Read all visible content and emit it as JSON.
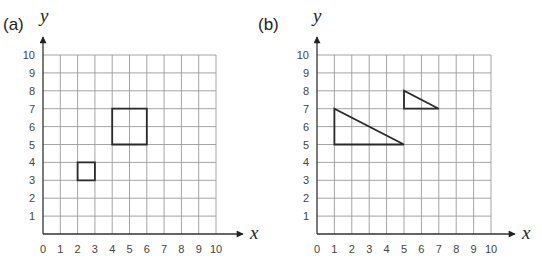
{
  "chart_data": [
    {
      "type": "diagram",
      "panel_label": "(a)",
      "xlabel": "x",
      "ylabel": "y",
      "xlim": [
        0,
        10
      ],
      "ylim": [
        0,
        10
      ],
      "grid": true,
      "x_ticks": [
        "0",
        "1",
        "2",
        "3",
        "4",
        "5",
        "6",
        "7",
        "8",
        "9",
        "10"
      ],
      "y_ticks": [
        "1",
        "2",
        "3",
        "4",
        "5",
        "6",
        "7",
        "8",
        "9",
        "10"
      ],
      "shapes": [
        {
          "name": "large-square",
          "kind": "rectangle",
          "points": [
            [
              4,
              5
            ],
            [
              6,
              5
            ],
            [
              6,
              7
            ],
            [
              4,
              7
            ]
          ]
        },
        {
          "name": "small-square",
          "kind": "rectangle",
          "points": [
            [
              2,
              3
            ],
            [
              3,
              3
            ],
            [
              3,
              4
            ],
            [
              2,
              4
            ]
          ]
        }
      ]
    },
    {
      "type": "diagram",
      "panel_label": "(b)",
      "xlabel": "x",
      "ylabel": "y",
      "xlim": [
        0,
        10
      ],
      "ylim": [
        0,
        10
      ],
      "grid": true,
      "x_ticks": [
        "0",
        "1",
        "2",
        "3",
        "4",
        "5",
        "6",
        "7",
        "8",
        "9",
        "10"
      ],
      "y_ticks": [
        "1",
        "2",
        "3",
        "4",
        "5",
        "6",
        "7",
        "8",
        "9",
        "10"
      ],
      "shapes": [
        {
          "name": "large-triangle",
          "kind": "triangle",
          "points": [
            [
              1,
              5
            ],
            [
              1,
              7
            ],
            [
              5,
              5
            ]
          ]
        },
        {
          "name": "small-triangle",
          "kind": "triangle",
          "points": [
            [
              5,
              7
            ],
            [
              5,
              8
            ],
            [
              7,
              7
            ]
          ]
        }
      ]
    }
  ],
  "layout": {
    "panels": [
      {
        "x0": 43,
        "x1": 216,
        "y0": 234,
        "y1": 55,
        "arrowX": 243,
        "arrowY": 37,
        "labelX": 3,
        "yVarX": 40,
        "xVarX": 250
      },
      {
        "x0": 317,
        "x1": 491,
        "y0": 234,
        "y1": 55,
        "arrowX": 515,
        "arrowY": 37,
        "labelX": 258,
        "yVarX": 313,
        "xVarX": 522
      }
    ]
  }
}
